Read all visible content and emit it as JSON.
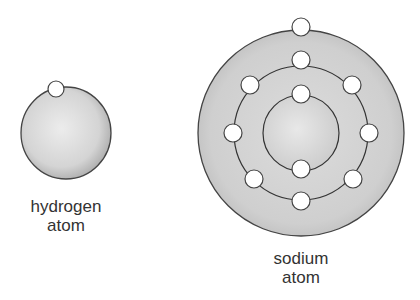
{
  "diagram": {
    "hydrogen": {
      "label_line1": "hydrogen",
      "label_line2": "atom",
      "electrons": 1
    },
    "sodium": {
      "label_line1": "sodium",
      "label_line2": "atom",
      "shells": [
        2,
        8,
        1
      ],
      "electrons": 11
    }
  }
}
